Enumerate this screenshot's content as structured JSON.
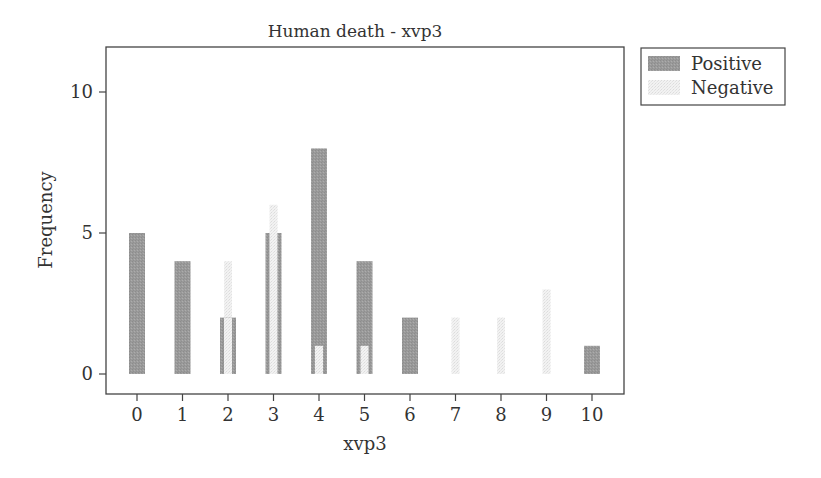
{
  "chart_data": {
    "type": "bar",
    "title": "Human death - xvp3",
    "xlabel": "xvp3",
    "ylabel": "Frequency",
    "categories": [
      "0",
      "1",
      "2",
      "3",
      "4",
      "5",
      "6",
      "7",
      "8",
      "9",
      "10"
    ],
    "series": [
      {
        "name": "Positive",
        "values": [
          5,
          4,
          2,
          5,
          8,
          4,
          2,
          0,
          0,
          0,
          1
        ],
        "color": "#999999"
      },
      {
        "name": "Negative",
        "values": [
          0,
          0,
          4,
          6,
          1,
          1,
          0,
          2,
          2,
          3,
          0
        ],
        "color": "#eeeeee"
      }
    ],
    "ylim": [
      -0.5,
      11.5
    ],
    "yticks": [
      0,
      5,
      10
    ],
    "xticks": [
      0,
      1,
      2,
      3,
      4,
      5,
      6,
      7,
      8,
      9,
      10
    ],
    "grid": false,
    "legend_position": "right-outside-top"
  },
  "legend": {
    "items": [
      {
        "label": "Positive",
        "color": "#999999"
      },
      {
        "label": "Negative",
        "color": "#eeeeee"
      }
    ]
  }
}
